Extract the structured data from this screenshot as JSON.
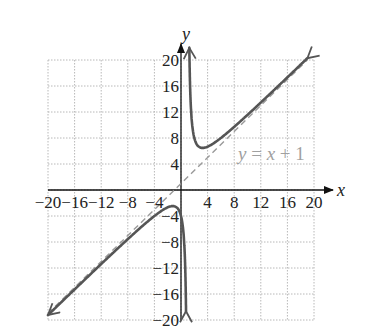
{
  "chart_data": {
    "type": "line",
    "title": "",
    "xlabel": "x",
    "ylabel": "y",
    "xlim": [
      -20,
      20
    ],
    "ylim": [
      -20,
      20
    ],
    "grid": true,
    "grid_step": 4,
    "x_ticks": [
      -20,
      -16,
      -12,
      -8,
      -4,
      4,
      8,
      12,
      16,
      20
    ],
    "y_ticks": [
      -20,
      -16,
      -12,
      -8,
      -4,
      4,
      8,
      12,
      16,
      20
    ],
    "x_tick_labels": [
      "−20",
      "−16",
      "−12",
      "−8",
      "−4",
      "4",
      "8",
      "12",
      "16",
      "20"
    ],
    "y_tick_labels": [
      "−20",
      "−16",
      "−12",
      "−8",
      "−4",
      "4",
      "8",
      "12",
      "16",
      "20"
    ],
    "function": "f(x) = (x^2 + 4)/(x - 1)",
    "vertical_asymptote": 1,
    "oblique_asymptote": {
      "label": "y = x + 1",
      "slope": 1,
      "intercept": 1,
      "style": "dashed"
    },
    "series": [
      {
        "name": "upper branch",
        "points": [
          [
            1.3,
            20
          ],
          [
            1.5,
            12.5
          ],
          [
            2,
            8
          ],
          [
            2.5,
            6.8
          ],
          [
            3.24,
            6.47
          ],
          [
            4,
            6.67
          ],
          [
            6,
            8
          ],
          [
            8,
            9.71
          ],
          [
            12,
            13.45
          ],
          [
            16,
            17.33
          ],
          [
            19,
            20.28
          ]
        ]
      },
      {
        "name": "lower branch",
        "points": [
          [
            -20,
            -19.24
          ],
          [
            -16,
            -15.29
          ],
          [
            -12,
            -11.38
          ],
          [
            -8,
            -7.56
          ],
          [
            -4,
            -4.0
          ],
          [
            -2,
            -2.67
          ],
          [
            -1.24,
            -2.47
          ],
          [
            -0.5,
            -2.83
          ],
          [
            0,
            -4
          ],
          [
            0.5,
            -9.5
          ],
          [
            0.75,
            -19
          ]
        ]
      }
    ],
    "legend": null
  },
  "labels": {
    "x_axis": "x",
    "y_axis": "y",
    "asymptote": {
      "y": "y",
      "eq": " = ",
      "x": "x",
      "rest": " + 1"
    }
  },
  "colors": {
    "curve": "#555555",
    "asymptote": "#9a9a9a",
    "grid": "#b8b8b8",
    "axis": "#111111",
    "label_gray": "#a0a0a0"
  }
}
